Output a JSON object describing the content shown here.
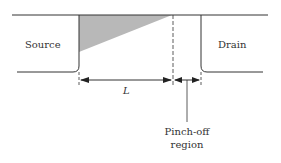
{
  "diagram": {
    "source_label": "Source",
    "drain_label": "Drain",
    "length_label": "L",
    "pinch_line1": "Pinch-off",
    "pinch_line2": "region"
  },
  "colors": {
    "line": "#333333",
    "shade": "#b8b8b8"
  }
}
